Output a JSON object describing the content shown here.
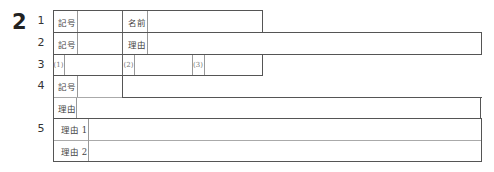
{
  "section_number": "2",
  "questions": [
    {
      "number": "1",
      "fields": [
        {
          "label": "記号"
        },
        {
          "label": "名前"
        }
      ]
    },
    {
      "number": "2",
      "fields": [
        {
          "label": "記号"
        },
        {
          "label": "理由"
        }
      ]
    },
    {
      "number": "3",
      "fields": [
        {
          "label": "(1)"
        },
        {
          "label": "(2)"
        },
        {
          "label": "(3)"
        }
      ]
    },
    {
      "number": "4",
      "fields": [
        {
          "label": "記号"
        },
        {
          "label": "理由"
        }
      ]
    },
    {
      "number": "5",
      "fields": [
        {
          "label": "理由 1"
        },
        {
          "label": "理由 2"
        }
      ]
    }
  ],
  "colors": {
    "border": "#555555",
    "light_border": "#aaaaaa",
    "text": "#333333"
  }
}
